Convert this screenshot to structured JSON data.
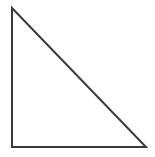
{
  "figure": {
    "kind": "geometric-figure",
    "shape_name": "right-triangle",
    "canvas": {
      "width": 155,
      "height": 157,
      "background_color": "#ffffff"
    },
    "stroke": {
      "color": "#3a3a3a",
      "width": 2
    },
    "fill_color": "none",
    "vertices": [
      {
        "name": "top-left-apex",
        "x": 12,
        "y": 8
      },
      {
        "name": "bottom-left-right-angle",
        "x": 12,
        "y": 147
      },
      {
        "name": "bottom-right",
        "x": 146,
        "y": 147
      }
    ],
    "edges": [
      {
        "name": "left-vertical-leg",
        "from": "top-left-apex",
        "to": "bottom-left-right-angle"
      },
      {
        "name": "bottom-horizontal-leg",
        "from": "bottom-left-right-angle",
        "to": "bottom-right"
      },
      {
        "name": "hypotenuse",
        "from": "bottom-right",
        "to": "top-left-apex"
      }
    ],
    "path": "M 12 8 L 12 147 L 146 147 Z",
    "labels": [],
    "annotations": []
  }
}
